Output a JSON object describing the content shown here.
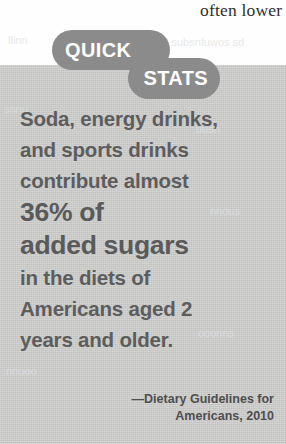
{
  "page": {
    "background_white": "#fefefe",
    "panel_gray": "#c8c8c6",
    "badge_gray": "#8b8b8b",
    "text_gray": "#5d5d5d"
  },
  "running_text": {
    "clipped_line": "often lower i"
  },
  "ghost_text": {
    "top_left": "llinn",
    "top_right": "ood subsnfuwos sd",
    "panel_1": "snnu",
    "panel_2": "uusn",
    "panel_3": "nnous",
    "panel_4": "ooonns",
    "panel_5": "nnuoo"
  },
  "badge": {
    "word_1": "QUICK",
    "word_2": "STATS"
  },
  "callout": {
    "lines": [
      {
        "text": "Soda, energy drinks,",
        "size": "normal"
      },
      {
        "text": "and sports drinks",
        "size": "normal"
      },
      {
        "text": "contribute almost",
        "size": "normal"
      },
      {
        "text": "36% of",
        "size": "big"
      },
      {
        "text": "added sugars",
        "size": "big"
      },
      {
        "text": "in the diets of",
        "size": "normal"
      },
      {
        "text": "Americans aged 2",
        "size": "normal"
      },
      {
        "text": "years and older.",
        "size": "normal"
      }
    ]
  },
  "attribution": {
    "line_1": "—Dietary Guidelines for",
    "line_2": "Americans, 2010"
  }
}
